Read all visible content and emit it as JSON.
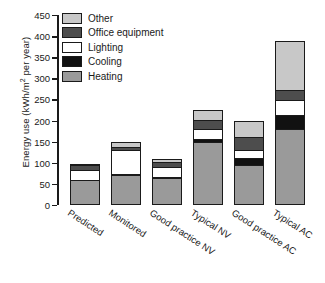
{
  "chart_data": {
    "type": "bar",
    "stacked": true,
    "title": "",
    "xlabel": "",
    "ylabel": "Energy use (kWh/m2 per year)",
    "ylabel_parts": {
      "pre": "Energy use (kWh/m",
      "sup": "2",
      "post": " per year)"
    },
    "ylim": [
      0,
      450
    ],
    "ytick_step": 50,
    "yticks": [
      "0",
      "50",
      "100",
      "150",
      "200",
      "250",
      "300",
      "350",
      "400",
      "450"
    ],
    "grid": false,
    "legend_position": "top-left",
    "categories": [
      "Predicted",
      "Monitored",
      "Good practice NV",
      "Typical NV",
      "Good practice AC",
      "Typical AC"
    ],
    "series": [
      {
        "name": "Heating",
        "color": "#9a9a9a",
        "values": [
          60,
          70,
          65,
          150,
          95,
          180
        ]
      },
      {
        "name": "Cooling",
        "color": "#111111",
        "values": [
          0,
          5,
          5,
          10,
          20,
          35
        ]
      },
      {
        "name": "Lighting",
        "color": "#ffffff",
        "values": [
          25,
          60,
          25,
          25,
          20,
          40
        ]
      },
      {
        "name": "Office equipment",
        "color": "#4d4d4d",
        "values": [
          15,
          10,
          15,
          25,
          35,
          25
        ]
      },
      {
        "name": "Other",
        "color": "#c8c8c8",
        "values": [
          3,
          15,
          10,
          25,
          40,
          120
        ]
      }
    ],
    "totals": [
      103,
      160,
      120,
      235,
      210,
      400
    ]
  },
  "legend": {
    "items": [
      {
        "label": "Other",
        "color": "#c8c8c8"
      },
      {
        "label": "Office equipment",
        "color": "#4d4d4d"
      },
      {
        "label": "Lighting",
        "color": "#ffffff"
      },
      {
        "label": "Cooling",
        "color": "#111111"
      },
      {
        "label": "Heating",
        "color": "#9a9a9a"
      }
    ]
  }
}
